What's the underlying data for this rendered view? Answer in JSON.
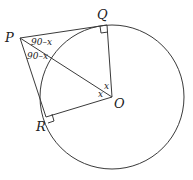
{
  "diagram": {
    "type": "circle-tangent-geometry",
    "points": {
      "P": {
        "label": "P",
        "x": 20,
        "y": 38
      },
      "Q": {
        "label": "Q",
        "x": 107,
        "y": 25
      },
      "O": {
        "label": "O",
        "x": 112,
        "y": 97
      },
      "R": {
        "label": "R",
        "x": 46,
        "y": 117
      }
    },
    "circle": {
      "center": "O",
      "radius": 72
    },
    "segments": [
      "PQ",
      "PR",
      "PO",
      "OQ",
      "OR"
    ],
    "right_angles": [
      "Q",
      "R"
    ],
    "angle_labels": {
      "QPO": "90–x",
      "RPO": "90–x",
      "QOP": "x",
      "ROP": "x"
    }
  }
}
